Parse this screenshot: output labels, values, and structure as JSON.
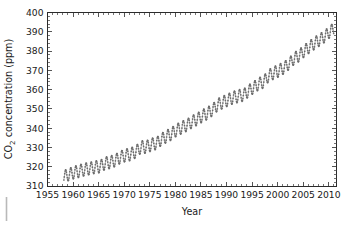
{
  "figure": {
    "background_color": "#ffffff",
    "frame_color": "#2b2b2b",
    "marker_color": "#6b6b6b"
  },
  "chart_data": {
    "type": "scatter",
    "title": "",
    "xlabel": "Year",
    "ylabel": "CO2 concentration (ppm)",
    "ylabel_parts": {
      "prefix": "CO",
      "subscript": "2",
      "suffix": " concentration (ppm)"
    },
    "xlim": [
      1955,
      2011.5
    ],
    "ylim": [
      310,
      400
    ],
    "xticks": [
      1955,
      1960,
      1965,
      1970,
      1975,
      1980,
      1985,
      1990,
      1995,
      2000,
      2005,
      2010
    ],
    "yticks": [
      310,
      320,
      330,
      340,
      350,
      360,
      370,
      380,
      390,
      400
    ],
    "xtick_labels": [
      "1955",
      "1960",
      "1965",
      "1970",
      "1975",
      "1980",
      "1985",
      "1990",
      "1995",
      "2000",
      "2005",
      "2010"
    ],
    "ytick_labels": [
      "310",
      "320",
      "330",
      "340",
      "350",
      "360",
      "370",
      "380",
      "390",
      "400"
    ],
    "x_minor_step": 1,
    "y_minor_step": 2,
    "grid": false,
    "legend": null,
    "ticks_direction": "in",
    "seasonal_amplitude_ppm": 3.2,
    "series": [
      {
        "name": "Mauna Loa monthly mean CO2",
        "x": [
          1958.2,
          1958.7,
          1959.0,
          1959.5,
          1960.0,
          1960.5,
          1961.0,
          1961.5,
          1962.0,
          1962.5,
          1963.0,
          1963.5,
          1964.0,
          1964.5,
          1965.0,
          1965.5,
          1966.0,
          1966.5,
          1967.0,
          1967.5,
          1968.0,
          1968.5,
          1969.0,
          1969.5,
          1970.0,
          1970.5,
          1971.0,
          1971.5,
          1972.0,
          1972.5,
          1973.0,
          1973.5,
          1974.0,
          1974.5,
          1975.0,
          1975.5,
          1976.0,
          1976.5,
          1977.0,
          1977.5,
          1978.0,
          1978.5,
          1979.0,
          1979.5,
          1980.0,
          1980.5,
          1981.0,
          1981.5,
          1982.0,
          1982.5,
          1983.0,
          1983.5,
          1984.0,
          1984.5,
          1985.0,
          1985.5,
          1986.0,
          1986.5,
          1987.0,
          1987.5,
          1988.0,
          1988.5,
          1989.0,
          1989.5,
          1990.0,
          1990.5,
          1991.0,
          1991.5,
          1992.0,
          1992.5,
          1993.0,
          1993.5,
          1994.0,
          1994.5,
          1995.0,
          1995.5,
          1996.0,
          1996.5,
          1997.0,
          1997.5,
          1998.0,
          1998.5,
          1999.0,
          1999.5,
          2000.0,
          2000.5,
          2001.0,
          2001.5,
          2002.0,
          2002.5,
          2003.0,
          2003.5,
          2004.0,
          2004.5,
          2005.0,
          2005.5,
          2006.0,
          2006.5,
          2007.0,
          2007.5,
          2008.0,
          2008.5,
          2009.0,
          2009.5,
          2010.0,
          2010.5,
          2011.0
        ],
        "y_annual_mean": [
          315.0,
          315.3,
          315.9,
          316.2,
          316.9,
          317.2,
          317.6,
          318.0,
          318.4,
          318.7,
          319.0,
          319.2,
          319.6,
          319.9,
          320.0,
          320.4,
          321.4,
          321.9,
          322.2,
          322.5,
          323.1,
          323.6,
          324.6,
          325.2,
          325.7,
          326.1,
          326.3,
          326.8,
          327.5,
          328.2,
          329.7,
          330.3,
          330.2,
          330.5,
          331.1,
          331.6,
          332.0,
          332.4,
          333.8,
          334.5,
          335.4,
          336.0,
          336.8,
          337.5,
          338.7,
          339.2,
          340.1,
          340.6,
          341.4,
          341.8,
          343.0,
          343.6,
          344.4,
          344.9,
          346.0,
          346.6,
          347.4,
          348.0,
          349.2,
          349.9,
          351.6,
          352.4,
          353.1,
          353.6,
          354.4,
          354.8,
          355.6,
          356.0,
          356.4,
          356.8,
          357.1,
          357.4,
          358.8,
          359.5,
          360.8,
          361.3,
          362.6,
          363.2,
          363.8,
          364.6,
          366.7,
          367.5,
          368.4,
          369.0,
          369.6,
          370.2,
          371.1,
          371.7,
          373.2,
          373.9,
          375.8,
          376.5,
          377.5,
          378.2,
          379.8,
          380.5,
          381.9,
          382.6,
          383.8,
          384.5,
          385.6,
          386.2,
          387.4,
          388.1,
          389.8,
          390.5,
          391.9
        ],
        "units": "ppm"
      }
    ]
  }
}
